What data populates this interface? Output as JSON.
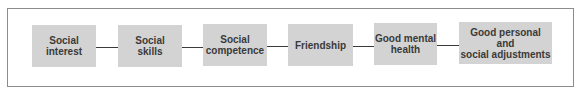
{
  "diagram": {
    "type": "flow",
    "nodes": [
      {
        "id": "n1",
        "label": "Social\ninterest"
      },
      {
        "id": "n2",
        "label": "Social\nskills"
      },
      {
        "id": "n3",
        "label": "Social\ncompetence"
      },
      {
        "id": "n4",
        "label": "Friendship"
      },
      {
        "id": "n5",
        "label": "Good mental\nhealth"
      },
      {
        "id": "n6",
        "label": "Good personal\nand\nsocial adjustments"
      }
    ],
    "edges": [
      {
        "from": "n1",
        "to": "n2"
      },
      {
        "from": "n2",
        "to": "n3"
      },
      {
        "from": "n3",
        "to": "n4"
      },
      {
        "from": "n4",
        "to": "n5"
      },
      {
        "from": "n5",
        "to": "n6"
      }
    ],
    "colors": {
      "box_fill": "#d3d3d3",
      "text": "#3a3a3a",
      "line": "#3a3a3a",
      "frame": "#8c8c8c"
    }
  }
}
